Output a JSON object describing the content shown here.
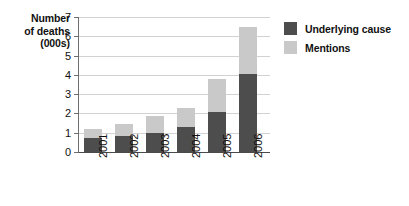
{
  "chart_data": {
    "type": "bar",
    "subtype": "stacked-bar",
    "title": "",
    "subtitle": "",
    "xlabel": "",
    "ylabel": "Number of deaths (000s)",
    "ylabel_lines": [
      "Number",
      "of deaths",
      "(000s)"
    ],
    "categories": [
      "2001",
      "2002",
      "2003",
      "2004",
      "2005",
      "2006"
    ],
    "ylim": [
      0,
      7
    ],
    "y_ticks": [
      0,
      1,
      2,
      3,
      4,
      5,
      6,
      7
    ],
    "y_tick_labels": [
      "0",
      "1",
      "2",
      "3",
      "4",
      "5",
      "6",
      "7"
    ],
    "grid": true,
    "grid_axis": "y",
    "legend_position": "right",
    "x_tick_rotation": 90,
    "series": [
      {
        "name": "Underlying cause",
        "color": "#4d4d4d",
        "values": [
          0.75,
          0.82,
          1.0,
          1.3,
          2.1,
          4.05
        ]
      },
      {
        "name": "Mentions",
        "color": "#c9c9c9",
        "values": [
          0.45,
          0.61,
          0.85,
          0.98,
          1.7,
          2.45
        ]
      }
    ],
    "stacked_totals": [
      1.2,
      1.43,
      1.85,
      2.28,
      3.8,
      6.5
    ],
    "annotations": []
  },
  "legend": {
    "items": [
      {
        "label": "Underlying cause",
        "color": "#4d4d4d"
      },
      {
        "label": "Mentions",
        "color": "#c9c9c9"
      }
    ]
  },
  "colors": {
    "underlying_cause": "#4d4d4d",
    "mentions": "#c9c9c9",
    "gridline": "#d2d2d2",
    "axis": "#4a4a4a",
    "text": "#111111",
    "background": "#ffffff"
  }
}
